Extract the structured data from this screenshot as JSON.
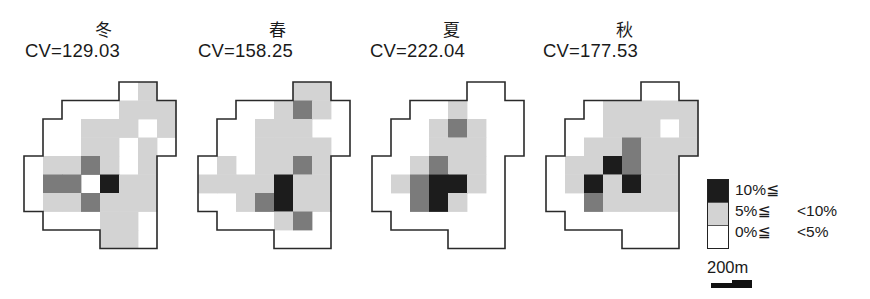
{
  "chart_data": {
    "type": "heatmap",
    "title": "",
    "grid": {
      "cols": 8,
      "rows": 9,
      "cell_width_px": 19,
      "cell_height_px": 18.5
    },
    "boundary_outline_grid": [
      [
        5,
        0
      ],
      [
        7,
        0
      ],
      [
        7,
        1
      ],
      [
        8,
        1
      ],
      [
        8,
        4
      ],
      [
        7,
        4
      ],
      [
        7,
        9
      ],
      [
        4,
        9
      ],
      [
        4,
        8
      ],
      [
        1,
        8
      ],
      [
        1,
        7
      ],
      [
        0,
        7
      ],
      [
        0,
        4
      ],
      [
        1,
        4
      ],
      [
        1,
        2
      ],
      [
        2,
        2
      ],
      [
        2,
        1
      ],
      [
        5,
        1
      ]
    ],
    "class_codes": {
      "0": "0%≦ <5%",
      "1": "5%≦ <10%",
      "2": "medium (unlabeled in legend)",
      "3": "10%≦"
    },
    "panels": [
      {
        "season": "冬",
        "cv": "CV=129.03",
        "cells": [
          [
            0,
            0,
            0,
            0,
            0,
            0,
            1,
            0
          ],
          [
            0,
            0,
            0,
            0,
            0,
            1,
            1,
            1
          ],
          [
            0,
            0,
            0,
            1,
            1,
            1,
            0,
            1
          ],
          [
            0,
            0,
            0,
            1,
            1,
            0,
            1,
            0
          ],
          [
            0,
            1,
            1,
            2,
            1,
            0,
            1,
            0
          ],
          [
            0,
            2,
            2,
            0,
            3,
            1,
            1,
            0
          ],
          [
            0,
            1,
            1,
            2,
            1,
            1,
            1,
            0
          ],
          [
            0,
            0,
            0,
            0,
            1,
            1,
            0,
            0
          ],
          [
            0,
            0,
            0,
            0,
            1,
            1,
            0,
            0
          ]
        ]
      },
      {
        "season": "春",
        "cv": "CV=158.25",
        "cells": [
          [
            0,
            0,
            0,
            0,
            0,
            1,
            1,
            0
          ],
          [
            0,
            0,
            0,
            0,
            1,
            2,
            1,
            0
          ],
          [
            0,
            0,
            0,
            1,
            1,
            1,
            0,
            0
          ],
          [
            0,
            0,
            0,
            1,
            1,
            1,
            1,
            0
          ],
          [
            0,
            1,
            0,
            1,
            1,
            2,
            1,
            0
          ],
          [
            1,
            1,
            1,
            1,
            3,
            1,
            1,
            0
          ],
          [
            0,
            0,
            1,
            2,
            3,
            1,
            1,
            0
          ],
          [
            0,
            0,
            0,
            0,
            1,
            2,
            0,
            0
          ],
          [
            0,
            0,
            0,
            0,
            0,
            0,
            0,
            0
          ]
        ]
      },
      {
        "season": "夏",
        "cv": "CV=222.04",
        "cells": [
          [
            0,
            0,
            0,
            0,
            0,
            0,
            0,
            0
          ],
          [
            0,
            0,
            0,
            0,
            1,
            0,
            0,
            0
          ],
          [
            0,
            0,
            0,
            1,
            2,
            1,
            0,
            0
          ],
          [
            0,
            0,
            0,
            1,
            1,
            1,
            0,
            0
          ],
          [
            0,
            0,
            1,
            2,
            1,
            1,
            0,
            0
          ],
          [
            0,
            1,
            2,
            3,
            3,
            1,
            0,
            0
          ],
          [
            0,
            0,
            2,
            3,
            1,
            0,
            0,
            0
          ],
          [
            0,
            0,
            0,
            0,
            0,
            0,
            0,
            0
          ],
          [
            0,
            0,
            0,
            0,
            0,
            0,
            0,
            0
          ]
        ]
      },
      {
        "season": "秋",
        "cv": "CV=177.53",
        "cells": [
          [
            0,
            0,
            0,
            0,
            0,
            0,
            0,
            0
          ],
          [
            0,
            0,
            0,
            1,
            1,
            1,
            1,
            1
          ],
          [
            0,
            0,
            0,
            1,
            1,
            1,
            0,
            1
          ],
          [
            0,
            0,
            1,
            1,
            2,
            1,
            1,
            1
          ],
          [
            0,
            1,
            1,
            3,
            2,
            1,
            1,
            0
          ],
          [
            0,
            1,
            3,
            1,
            3,
            1,
            1,
            0
          ],
          [
            0,
            0,
            2,
            1,
            1,
            1,
            1,
            0
          ],
          [
            0,
            0,
            0,
            0,
            0,
            0,
            0,
            0
          ],
          [
            0,
            0,
            0,
            0,
            0,
            0,
            0,
            0
          ]
        ]
      }
    ],
    "legend": [
      {
        "label_low": "10%≦",
        "label_high": "",
        "color": "#1c1c1c"
      },
      {
        "label_low": "5%≦",
        "label_high": "<10%",
        "color": "#d3d3d3"
      },
      {
        "label_low": "0%≦",
        "label_high": "<5%",
        "color": "#ffffff"
      }
    ],
    "scale_bar": "200m"
  },
  "colors": {
    "class_0": "#ffffff",
    "class_1": "#d3d3d3",
    "class_2": "#7b7b7b",
    "class_3": "#1c1c1c",
    "outline": "#2a2a2a"
  },
  "panels": [
    {
      "season": "冬",
      "cv": "CV=129.03"
    },
    {
      "season": "春",
      "cv": "CV=158.25"
    },
    {
      "season": "夏",
      "cv": "CV=222.04"
    },
    {
      "season": "秋",
      "cv": "CV=177.53"
    }
  ],
  "legend": {
    "items": [
      {
        "low": "10%≦",
        "high": ""
      },
      {
        "low": "5%≦",
        "high": "<10%"
      },
      {
        "low": "0%≦",
        "high": "<5%"
      }
    ]
  },
  "scale": {
    "label": "200m"
  }
}
